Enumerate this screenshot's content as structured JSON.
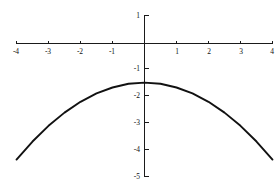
{
  "chart_data": {
    "type": "line",
    "title": "",
    "subtitle": "",
    "xlabel": "",
    "ylabel": "",
    "xlim": [
      -4,
      4
    ],
    "ylim": [
      -5,
      1
    ],
    "grid": false,
    "legend": null,
    "annotations": [],
    "x_ticks": [
      -4,
      -3,
      -2,
      -1,
      1,
      2,
      3,
      4
    ],
    "x_tick_labels": [
      "-4",
      "-3",
      "-2",
      "-1",
      "1",
      "2",
      "3",
      "4"
    ],
    "y_ticks": [
      1,
      -1,
      -2,
      -3,
      -4,
      -5
    ],
    "y_tick_labels": [
      "1",
      "-1",
      "-2",
      "-3",
      "-4",
      "-5"
    ],
    "series": [
      {
        "name": "parabola",
        "color": "#111111",
        "equation": "y = -0.178x^2 - 1.45",
        "x": [
          -4,
          -3.5,
          -3,
          -2.5,
          -2,
          -1.5,
          -1,
          -0.5,
          0,
          0.5,
          1,
          1.5,
          2,
          2.5,
          3,
          3.5,
          4
        ],
        "values": [
          -4.3,
          -3.63,
          -3.05,
          -2.56,
          -2.16,
          -1.85,
          -1.63,
          -1.49,
          -1.45,
          -1.49,
          -1.63,
          -1.85,
          -2.16,
          -2.56,
          -3.05,
          -3.63,
          -4.3
        ]
      }
    ]
  },
  "axes": {
    "x_axis_name": "x-axis",
    "y_axis_name": "y-axis",
    "axis_color": "#1a1a1a"
  },
  "figure": {
    "background": "#ffffff",
    "width": 280,
    "height": 184
  }
}
